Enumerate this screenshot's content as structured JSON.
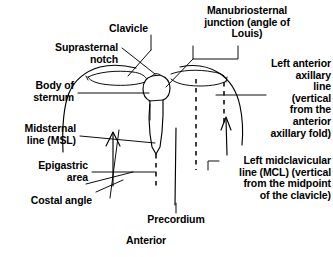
{
  "figure": {
    "orientation_label": "Anterior",
    "line_color": "#000000",
    "background_color": "#ffffff"
  },
  "labels": {
    "clavicle": "Clavicle",
    "suprasternal_notch": "Suprasternal\nnotch",
    "body_of_sternum": "Body of\nsternum",
    "midsternal_line": "Midsternal\nline (MSL)",
    "epigastric_area": "Epigastric\narea",
    "costal_angle": "Costal angle",
    "precordium": "Precordium",
    "manubriosternal_junction": "Manubriosternal\njunction (angle of\nLouis)",
    "left_anterior_axillary_line": "Left anterior\naxillary\nline\n(vertical\nfrom the\nanterior\naxillary fold)",
    "left_midclavicular_line": "Left midclavicular\nline (MCL) (vertical\nfrom the midpoint\nof the clavicle)",
    "anterior": "Anterior"
  },
  "structures": [
    {
      "name": "torso-outline",
      "kind": "body-contour"
    },
    {
      "name": "right-clavicle",
      "kind": "bone"
    },
    {
      "name": "left-clavicle",
      "kind": "bone"
    },
    {
      "name": "sternum",
      "kind": "bone"
    },
    {
      "name": "midsternal-line",
      "kind": "dashed-reference-line"
    },
    {
      "name": "midclavicular-line",
      "kind": "dashed-reference-line"
    },
    {
      "name": "anterior-axillary-line",
      "kind": "dashed-reference-line"
    },
    {
      "name": "precordium-marker",
      "kind": "solid-reference-line"
    },
    {
      "name": "costal-angle-marker",
      "kind": "angle-mark"
    }
  ]
}
